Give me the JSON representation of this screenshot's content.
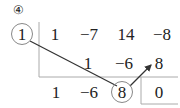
{
  "problem_label": "④",
  "divisor": "1",
  "rows": {
    "coefficients": [
      "1",
      "−7",
      "14",
      "−8"
    ],
    "products": [
      "1",
      "−6",
      "8"
    ],
    "results": [
      "1",
      "−6",
      "8"
    ],
    "remainder": "0"
  },
  "colors": {
    "text": "#222222",
    "line": "#999999",
    "arrow": "#333333",
    "circle": "#888888"
  }
}
